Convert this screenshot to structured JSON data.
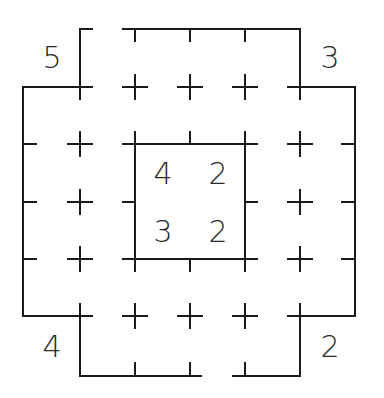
{
  "puzzle": {
    "type": "grid-puzzle",
    "line_color": "#1a1a1a",
    "text_color": "#333333",
    "background": "#ffffff",
    "outer_clues": {
      "top_left": "5",
      "top_right": "3",
      "bottom_left": "4",
      "bottom_right": "2"
    },
    "inner_clues": {
      "r1c1": "4",
      "r1c2": "2",
      "r2c1": "3",
      "r2c2": "2"
    }
  }
}
